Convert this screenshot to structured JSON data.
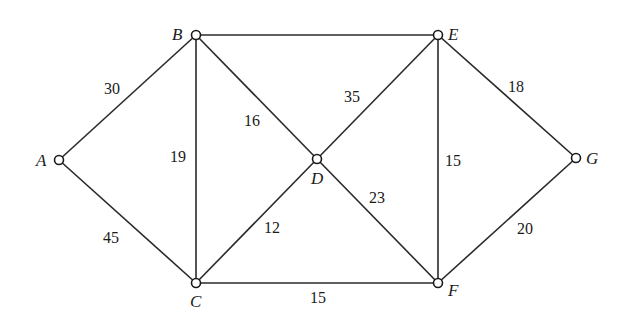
{
  "diagram": {
    "type": "weighted-undirected-graph",
    "nodes": [
      {
        "id": "A",
        "label": "A",
        "x": 59,
        "y": 160,
        "lx": 36,
        "ly": 166
      },
      {
        "id": "B",
        "label": "B",
        "x": 196,
        "y": 35,
        "lx": 172,
        "ly": 40
      },
      {
        "id": "C",
        "label": "C",
        "x": 196,
        "y": 283,
        "lx": 190,
        "ly": 307
      },
      {
        "id": "D",
        "label": "D",
        "x": 317,
        "y": 159,
        "lx": 311,
        "ly": 184
      },
      {
        "id": "E",
        "label": "E",
        "x": 438,
        "y": 35,
        "lx": 448,
        "ly": 40
      },
      {
        "id": "F",
        "label": "F",
        "x": 438,
        "y": 283,
        "lx": 448,
        "ly": 296
      },
      {
        "id": "G",
        "label": "G",
        "x": 576,
        "y": 158,
        "lx": 586,
        "ly": 164
      }
    ],
    "edges": [
      {
        "from": "A",
        "to": "B",
        "weight": "30",
        "wx": 104,
        "wy": 94
      },
      {
        "from": "A",
        "to": "C",
        "weight": "45",
        "wx": 103,
        "wy": 243
      },
      {
        "from": "B",
        "to": "C",
        "weight": "19",
        "wx": 170,
        "wy": 162
      },
      {
        "from": "B",
        "to": "D",
        "weight": "16",
        "wx": 244,
        "wy": 126
      },
      {
        "from": "B",
        "to": "E",
        "weight": "",
        "wx": 317,
        "wy": 30
      },
      {
        "from": "C",
        "to": "D",
        "weight": "12",
        "wx": 264,
        "wy": 233
      },
      {
        "from": "C",
        "to": "F",
        "weight": "15",
        "wx": 310,
        "wy": 303
      },
      {
        "from": "D",
        "to": "E",
        "weight": "35",
        "wx": 344,
        "wy": 102
      },
      {
        "from": "D",
        "to": "F",
        "weight": "23",
        "wx": 369,
        "wy": 203
      },
      {
        "from": "E",
        "to": "F",
        "weight": "15",
        "wx": 445,
        "wy": 166
      },
      {
        "from": "E",
        "to": "G",
        "weight": "18",
        "wx": 508,
        "wy": 92
      },
      {
        "from": "F",
        "to": "G",
        "weight": "20",
        "wx": 517,
        "wy": 234
      }
    ]
  }
}
